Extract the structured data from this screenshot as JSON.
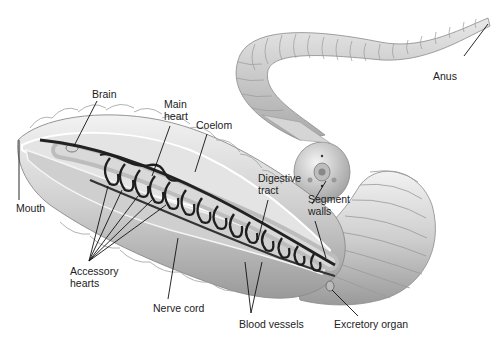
{
  "figure": {
    "colors": {
      "body_light": "#e6e6e6",
      "body_mid": "#c4c4c4",
      "body_dark": "#8c8c8c",
      "vessel": "#2a2a2a",
      "label_text": "#222222",
      "leader_line": "#111111"
    },
    "labels": {
      "brain": "Brain",
      "main_heart_1": "Main",
      "main_heart_2": "heart",
      "coelom": "Coelom",
      "mouth": "Mouth",
      "accessory_hearts_1": "Accessory",
      "accessory_hearts_2": "hearts",
      "nerve_cord": "Nerve cord",
      "digestive_tract_1": "Digestive",
      "digestive_tract_2": "tract",
      "segment_walls_1": "Segment",
      "segment_walls_2": "walls",
      "blood_vessels": "Blood vessels",
      "excretory_organ": "Excretory organ",
      "anus": "Anus"
    }
  }
}
